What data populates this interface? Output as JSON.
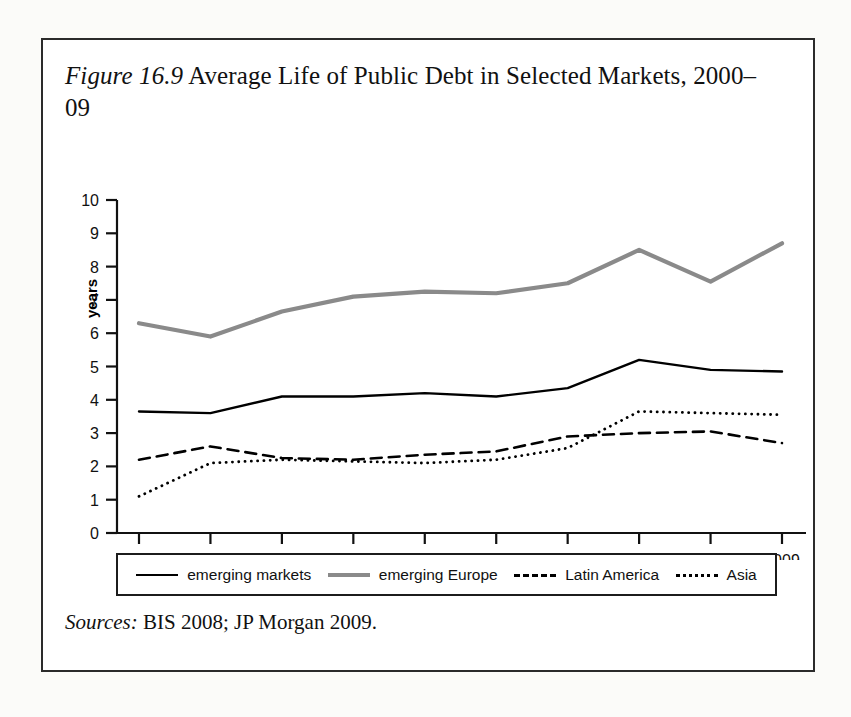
{
  "figure": {
    "label": "Figure 16.9",
    "caption_rest": " Average Life of Public Debt in Selected Markets, 2000–09",
    "source_label": "Sources:",
    "source_text": " BIS 2008; JP Morgan 2009."
  },
  "colors": {
    "emerging_markets": "#000000",
    "emerging_europe": "#8a8a8a",
    "latin_america": "#000000",
    "asia": "#000000",
    "axis": "#111111",
    "frame": "#2b2b2b"
  },
  "legend": {
    "items": [
      {
        "label": "emerging markets",
        "style": "solid-black"
      },
      {
        "label": "emerging Europe",
        "style": "solid-gray"
      },
      {
        "label": "Latin America",
        "style": "dashed"
      },
      {
        "label": "Asia",
        "style": "dotted"
      }
    ]
  },
  "chart_data": {
    "type": "line",
    "title": "Figure 16.9 Average Life of Public Debt in Selected Markets, 2000–09",
    "xlabel": "",
    "ylabel": "years",
    "x": [
      2000,
      2001,
      2002,
      2003,
      2004,
      2005,
      2006,
      2007,
      2008,
      2009
    ],
    "categories": [
      "2000",
      "2001",
      "2002",
      "2003",
      "2004",
      "2005",
      "2006",
      "2007",
      "2008",
      "2009"
    ],
    "ylim": [
      0,
      10
    ],
    "yticks": [
      0,
      1,
      2,
      3,
      4,
      5,
      6,
      7,
      8,
      9,
      10
    ],
    "ytick_labels": [
      "0",
      "1",
      "2",
      "3",
      "4",
      "5",
      "6",
      "7",
      "8",
      "9",
      "10"
    ],
    "grid": false,
    "legend_position": "bottom",
    "series": [
      {
        "name": "emerging markets",
        "style": "solid",
        "color": "#000000",
        "width": 2.4,
        "values": [
          3.65,
          3.6,
          4.1,
          4.1,
          4.2,
          4.1,
          4.35,
          5.2,
          4.9,
          4.85
        ]
      },
      {
        "name": "emerging Europe",
        "style": "solid",
        "color": "#8a8a8a",
        "width": 4.2,
        "values": [
          6.3,
          5.9,
          6.65,
          7.1,
          7.25,
          7.2,
          7.5,
          8.5,
          7.55,
          8.7
        ]
      },
      {
        "name": "Latin America",
        "style": "dashed",
        "color": "#000000",
        "width": 2.6,
        "values": [
          2.2,
          2.6,
          2.25,
          2.2,
          2.35,
          2.45,
          2.9,
          3.0,
          3.05,
          2.7
        ]
      },
      {
        "name": "Asia",
        "style": "dotted",
        "color": "#000000",
        "width": 2.8,
        "values": [
          1.1,
          2.1,
          2.2,
          2.15,
          2.1,
          2.2,
          2.55,
          3.65,
          3.6,
          3.55
        ]
      }
    ]
  }
}
